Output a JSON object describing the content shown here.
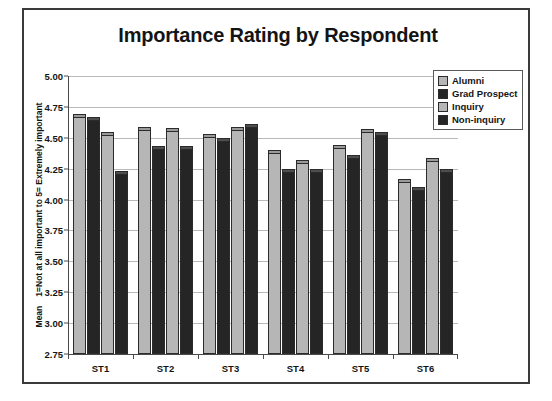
{
  "chart_data": {
    "type": "bar",
    "title": "Importance Rating by Respondent",
    "xlabel": "",
    "ylabel": "Mean\n1=Not at all important to 5= Extremely important",
    "ylabel_lines": [
      "Mean",
      "1=Not at all important to 5= Extremely important"
    ],
    "categories": [
      "ST1",
      "ST2",
      "ST3",
      "ST4",
      "ST5",
      "ST6"
    ],
    "series": [
      {
        "name": "Alumni",
        "color": "#b6b6b6",
        "values": [
          4.69,
          4.59,
          4.53,
          4.4,
          4.44,
          4.17
        ]
      },
      {
        "name": "Grad Prospect",
        "color": "#252525",
        "values": [
          4.67,
          4.43,
          4.5,
          4.25,
          4.36,
          4.1
        ]
      },
      {
        "name": "Inquiry",
        "color": "#b6b6b6",
        "values": [
          4.55,
          4.58,
          4.59,
          4.32,
          4.57,
          4.34
        ]
      },
      {
        "name": "Non-inquiry",
        "color": "#252525",
        "values": [
          4.23,
          4.43,
          4.61,
          4.25,
          4.55,
          4.25
        ]
      }
    ],
    "ylim": [
      2.75,
      5.0
    ],
    "ytick_step": 0.25,
    "yticks": [
      "5.00",
      "4.75",
      "4.50",
      "4.25",
      "4.00",
      "3.75",
      "3.50",
      "3.25",
      "3.00",
      "2.75"
    ],
    "grid": true,
    "legend_position": "top-right"
  }
}
